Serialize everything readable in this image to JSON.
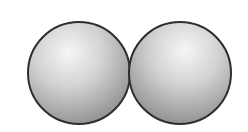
{
  "diagram": {
    "type": "two-touching-spheres",
    "background": "#ffffff",
    "outline_color": "#2e2e2e",
    "spheres": [
      {
        "id": "left",
        "cx": 79,
        "cy": 73,
        "r": 51,
        "highlight": {
          "fx": 0.4,
          "fy": 0.3
        }
      },
      {
        "id": "right",
        "cx": 180,
        "cy": 73,
        "r": 51,
        "highlight": {
          "fx": 0.55,
          "fy": 0.28
        }
      }
    ],
    "colors": {
      "highlight": "#f4f4f4",
      "mid": "#c9c9c9",
      "shadow": "#8f8f8f"
    }
  }
}
